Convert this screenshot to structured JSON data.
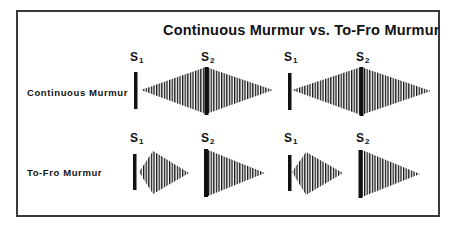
{
  "figure": {
    "title": "Continuous Murmur vs. To-Fro Murmur",
    "rows": [
      {
        "label": "Continuous Murmur",
        "cycles": [
          {
            "s1": {
              "base": "S",
              "sub": "1"
            },
            "s2": {
              "base": "S",
              "sub": "2"
            },
            "shape": "crescendo-decrescendo peaking at S2, spanning systole and diastole"
          },
          {
            "s1": {
              "base": "S",
              "sub": "1"
            },
            "s2": {
              "base": "S",
              "sub": "2"
            },
            "shape": "crescendo-decrescendo peaking at S2, spanning systole and diastole"
          }
        ]
      },
      {
        "label": "To-Fro Murmur",
        "cycles": [
          {
            "s1": {
              "base": "S",
              "sub": "1"
            },
            "s2": {
              "base": "S",
              "sub": "2"
            },
            "shape": "systolic diamond after S1, separate decrescendo diastolic murmur after S2"
          },
          {
            "s1": {
              "base": "S",
              "sub": "1"
            },
            "s2": {
              "base": "S",
              "sub": "2"
            },
            "shape": "systolic diamond after S1, separate decrescendo diastolic murmur after S2"
          }
        ]
      }
    ]
  },
  "colors": {
    "ink": "#111111",
    "frame": "#3a3a3a",
    "background": "#ffffff"
  }
}
